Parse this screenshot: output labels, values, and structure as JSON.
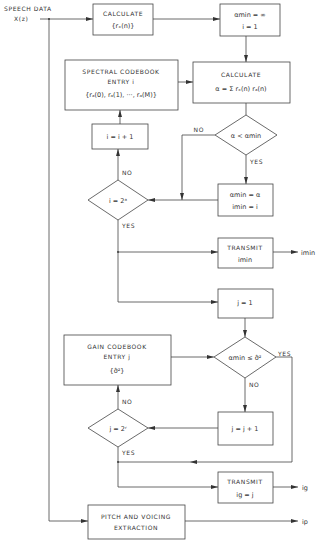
{
  "input": {
    "label_line1": "SPEECH DATA",
    "label_line2": "X(z)"
  },
  "nodes": {
    "calc_rx": {
      "line1": "CALCULATE",
      "line2": "{rₓ(n)}"
    },
    "init": {
      "line1": "αmin = ∞",
      "line2": "i = 1"
    },
    "spectral_codebook": {
      "line1": "SPECTRAL CODEBOOK",
      "line2": "ENTRY i",
      "line3": "{rₐ(0), rₐ(1), ···, rₐ(M)}"
    },
    "calc_alpha": {
      "line1": "CALCULATE",
      "line2": "α = Σ rₓ(n) rₐ(n)",
      "sum_index": "n"
    },
    "decision_alpha": {
      "text": "α < αmin",
      "yes": "YES",
      "no": "NO"
    },
    "increment_i": {
      "text": "i = i + 1"
    },
    "decision_i": {
      "text": "i = 2ᵃ",
      "yes": "YES",
      "no": "NO"
    },
    "update_min": {
      "line1": "αmin = α",
      "line2": "imin = i"
    },
    "transmit_imin": {
      "line1": "TRANSMIT",
      "line2": "imin",
      "output": "imin"
    },
    "init_j": {
      "text": "j = 1"
    },
    "gain_codebook": {
      "line1": "GAIN CODEBOOK",
      "line2": "ENTRY j",
      "line3": "{σ̂²}"
    },
    "decision_gain": {
      "text": "αmin ≤ σ̂²",
      "yes": "YES",
      "no": "NO"
    },
    "increment_j": {
      "text": "j = j + 1"
    },
    "decision_j": {
      "text": "j = 2ʳ",
      "yes": "YES",
      "no": "NO"
    },
    "transmit_ig": {
      "line1": "TRANSMIT",
      "line2": "ig = j",
      "output": "ig"
    },
    "pitch": {
      "line1": "PITCH AND VOICING",
      "line2": "EXTRACTION",
      "output": "ip"
    }
  }
}
